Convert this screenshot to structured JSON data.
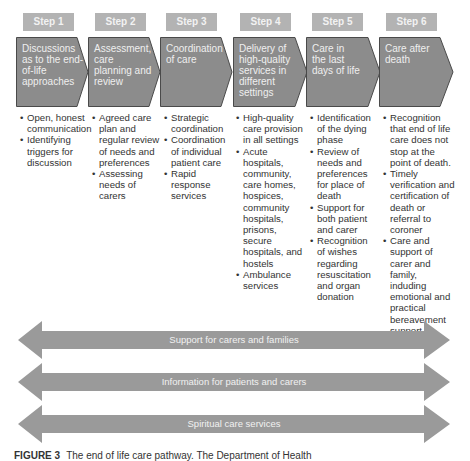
{
  "colors": {
    "step_label_bg": "#b3b3b3",
    "chevron_fill": "#8c8c8c",
    "chevron_stroke": "#4a4a4a",
    "band_fill": "#9a9a9a",
    "bullet_text": "#333333"
  },
  "steps": [
    {
      "label": "Step 1",
      "title": "Discussions as to the end-of-life approaches",
      "bullets": [
        "Open, honest communication",
        "Identifying triggers for discussion"
      ]
    },
    {
      "label": "Step 2",
      "title": "Assessment, care planning and review",
      "bullets": [
        "Agreed care plan and regular review of needs and preferences",
        "Assessing needs of carers"
      ]
    },
    {
      "label": "Step 3",
      "title": "Coordination of care",
      "bullets": [
        "Strategic coordination",
        "Coordination of individual patient care",
        "Rapid response services"
      ]
    },
    {
      "label": "Step 4",
      "title": "Delivery of high-quality services in different settings",
      "bullets": [
        "High-quality care provision in all settings",
        "Acute hospitals, community, care homes, hospices, community hospitals, prisons, secure hospitals, and hostels",
        "Ambulance services"
      ]
    },
    {
      "label": "Step 5",
      "title": "Care in the last days of life",
      "bullets": [
        "Identification of the dying phase",
        "Review of needs and preferences for place of death",
        "Support for both patient and carer",
        "Recognition of wishes regarding resuscitation and organ donation"
      ]
    },
    {
      "label": "Step 6",
      "title": "Care after death",
      "bullets": [
        "Recognition that end of life care does not stop at the point of death.",
        "Timely verification and certification of death or referral to coroner",
        "Care and support of carer and family, induding emotional and practical bereavement support"
      ]
    }
  ],
  "bands": [
    {
      "label": "Support for carers and families"
    },
    {
      "label": "Information for patients and carers"
    },
    {
      "label": "Spiritual care services"
    }
  ],
  "caption": {
    "prefix": "FIGURE 3",
    "text": "The end of life care pathway. The Department of Health"
  }
}
